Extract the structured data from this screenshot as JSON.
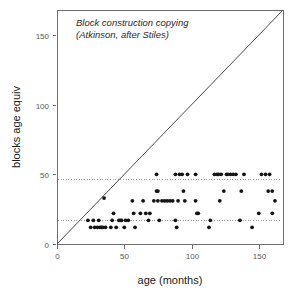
{
  "chart_data": {
    "type": "scatter",
    "title": "",
    "annotation_lines": [
      "Block construction copying",
      "(Atkinson, after Stiles)"
    ],
    "xlabel": "age (months)",
    "ylabel": "blocks age equiv",
    "xlim": [
      0,
      168
    ],
    "ylim": [
      0,
      168
    ],
    "xticks": [
      0,
      50,
      100,
      150
    ],
    "yticks": [
      0,
      50,
      100,
      150
    ],
    "xtick_labels": [
      "0",
      "50",
      "100",
      "150"
    ],
    "ytick_labels": [
      "0",
      "50",
      "100",
      "150"
    ],
    "grid": false,
    "legend": "none",
    "reference_lines": [
      {
        "name": "upper-dotted-reference",
        "orientation": "horizontal",
        "y": 47,
        "style": "dotted"
      },
      {
        "name": "lower-dotted-reference",
        "orientation": "horizontal",
        "y": 17,
        "style": "dotted"
      }
    ],
    "identity_line": {
      "name": "identity-line",
      "from": [
        0,
        0
      ],
      "to": [
        168,
        168
      ],
      "style": "solid"
    },
    "series": [
      {
        "name": "blocks-age-equivalent",
        "marker": "filled-circle",
        "color": "#141414",
        "points": [
          [
            23,
            17
          ],
          [
            25,
            12
          ],
          [
            27,
            17
          ],
          [
            28,
            12
          ],
          [
            30,
            12
          ],
          [
            31,
            17
          ],
          [
            32,
            12
          ],
          [
            33,
            12
          ],
          [
            34,
            12
          ],
          [
            35,
            33
          ],
          [
            36,
            12
          ],
          [
            40,
            12
          ],
          [
            41,
            17
          ],
          [
            42,
            22
          ],
          [
            44,
            12
          ],
          [
            46,
            17
          ],
          [
            47,
            17
          ],
          [
            48,
            17
          ],
          [
            50,
            12
          ],
          [
            51,
            17
          ],
          [
            53,
            17
          ],
          [
            56,
            31
          ],
          [
            57,
            22
          ],
          [
            58,
            12
          ],
          [
            62,
            22
          ],
          [
            64,
            31
          ],
          [
            66,
            22
          ],
          [
            68,
            17
          ],
          [
            69,
            22
          ],
          [
            72,
            31
          ],
          [
            74,
            38
          ],
          [
            74,
            50
          ],
          [
            75,
            38
          ],
          [
            75,
            31
          ],
          [
            76,
            17
          ],
          [
            78,
            31
          ],
          [
            80,
            31
          ],
          [
            82,
            31
          ],
          [
            84,
            31
          ],
          [
            86,
            31
          ],
          [
            88,
            50
          ],
          [
            88,
            17
          ],
          [
            89,
            12
          ],
          [
            90,
            31
          ],
          [
            91,
            50
          ],
          [
            93,
            50
          ],
          [
            94,
            38
          ],
          [
            95,
            31
          ],
          [
            97,
            50
          ],
          [
            103,
            50
          ],
          [
            103,
            31
          ],
          [
            104,
            22
          ],
          [
            105,
            22
          ],
          [
            113,
            12
          ],
          [
            114,
            17
          ],
          [
            117,
            50
          ],
          [
            119,
            50
          ],
          [
            120,
            50
          ],
          [
            121,
            31
          ],
          [
            122,
            50
          ],
          [
            124,
            38
          ],
          [
            126,
            50
          ],
          [
            127,
            50
          ],
          [
            129,
            50
          ],
          [
            131,
            50
          ],
          [
            133,
            50
          ],
          [
            136,
            17
          ],
          [
            137,
            38
          ],
          [
            139,
            50
          ],
          [
            145,
            12
          ],
          [
            150,
            22
          ],
          [
            152,
            50
          ],
          [
            155,
            50
          ],
          [
            157,
            38
          ],
          [
            158,
            50
          ],
          [
            160,
            38
          ],
          [
            160,
            22
          ],
          [
            162,
            31
          ]
        ]
      }
    ]
  },
  "geometry": {
    "plot_left": 57,
    "plot_right": 283,
    "plot_top": 10,
    "plot_bottom": 244
  }
}
